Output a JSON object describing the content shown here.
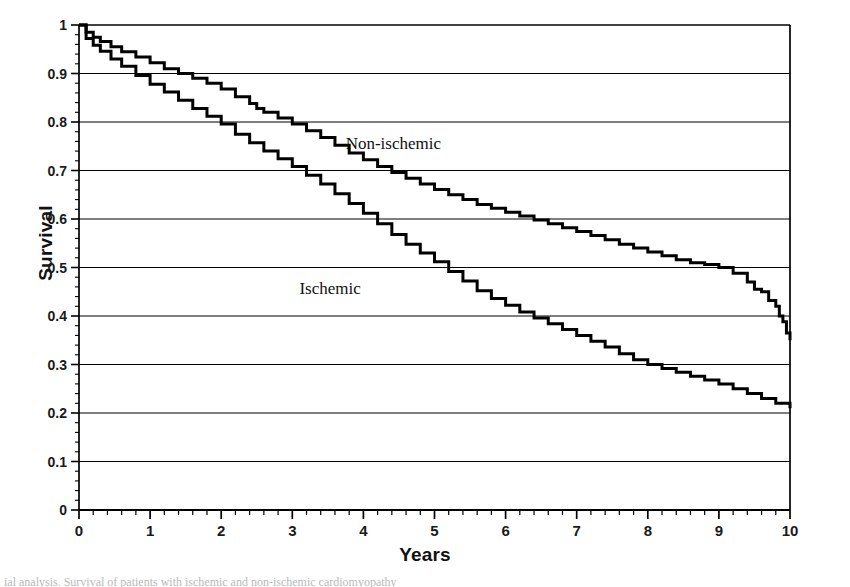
{
  "figure": {
    "background": "#ffffff",
    "ink": "#000000",
    "caption_partial": "ial analysis. Survival of patients with ischemic and non-ischemic cardiomyopathy"
  },
  "chart_data": {
    "type": "line",
    "title": "",
    "subtitle": "",
    "xlabel": "Years",
    "ylabel": "Survival",
    "xlim": [
      0,
      10
    ],
    "ylim": [
      0,
      1
    ],
    "grid": "horizontal",
    "legend_position": "inline-annotation",
    "x_major_step": 1,
    "x_minor_step": 0.2,
    "y_major_step": 0.1,
    "y_minor_step": 0.02,
    "xticks": [
      "0",
      "1",
      "2",
      "3",
      "4",
      "5",
      "6",
      "7",
      "8",
      "9",
      "10"
    ],
    "yticks": [
      "0",
      "0.1",
      "0.2",
      "0.3",
      "0.4",
      "0.5",
      "0.6",
      "0.7",
      "0.8",
      "0.9",
      "1"
    ],
    "annotations": [
      {
        "text": "Non-ischemic",
        "x": 3.75,
        "y": 0.755
      },
      {
        "text": "Ischemic",
        "x": 3.1,
        "y": 0.455
      }
    ],
    "series": [
      {
        "name": "Non-ischemic",
        "color": "#000000",
        "line_width": 3.0,
        "style": "step",
        "x": [
          0,
          0.1,
          0.2,
          0.3,
          0.45,
          0.6,
          0.8,
          1.0,
          1.2,
          1.4,
          1.6,
          1.8,
          2.0,
          2.2,
          2.4,
          2.5,
          2.6,
          2.8,
          3.0,
          3.2,
          3.4,
          3.6,
          3.8,
          4.0,
          4.2,
          4.4,
          4.6,
          4.8,
          5.0,
          5.2,
          5.4,
          5.6,
          5.8,
          6.0,
          6.2,
          6.4,
          6.6,
          6.8,
          7.0,
          7.2,
          7.4,
          7.6,
          7.8,
          8.0,
          8.2,
          8.4,
          8.6,
          8.8,
          9.0,
          9.2,
          9.4,
          9.5,
          9.6,
          9.7,
          9.8,
          9.85,
          9.9,
          9.95,
          10.0
        ],
        "y": [
          1.0,
          0.985,
          0.975,
          0.966,
          0.955,
          0.945,
          0.934,
          0.922,
          0.91,
          0.9,
          0.89,
          0.88,
          0.868,
          0.852,
          0.838,
          0.828,
          0.82,
          0.808,
          0.796,
          0.782,
          0.768,
          0.752,
          0.736,
          0.722,
          0.708,
          0.696,
          0.684,
          0.672,
          0.661,
          0.65,
          0.64,
          0.63,
          0.622,
          0.614,
          0.606,
          0.598,
          0.59,
          0.582,
          0.574,
          0.566,
          0.557,
          0.548,
          0.54,
          0.532,
          0.524,
          0.516,
          0.51,
          0.506,
          0.5,
          0.488,
          0.47,
          0.455,
          0.45,
          0.432,
          0.42,
          0.4,
          0.388,
          0.365,
          0.35
        ]
      },
      {
        "name": "Ischemic",
        "color": "#000000",
        "line_width": 3.0,
        "style": "step",
        "x": [
          0,
          0.1,
          0.2,
          0.3,
          0.45,
          0.6,
          0.8,
          1.0,
          1.2,
          1.4,
          1.6,
          1.8,
          2.0,
          2.2,
          2.4,
          2.6,
          2.8,
          3.0,
          3.2,
          3.4,
          3.6,
          3.8,
          4.0,
          4.2,
          4.4,
          4.6,
          4.8,
          5.0,
          5.2,
          5.4,
          5.6,
          5.8,
          6.0,
          6.2,
          6.4,
          6.6,
          6.8,
          7.0,
          7.2,
          7.4,
          7.6,
          7.8,
          8.0,
          8.2,
          8.4,
          8.6,
          8.8,
          9.0,
          9.2,
          9.4,
          9.6,
          9.8,
          10.0
        ],
        "y": [
          1.0,
          0.972,
          0.958,
          0.946,
          0.93,
          0.915,
          0.896,
          0.878,
          0.862,
          0.845,
          0.828,
          0.812,
          0.796,
          0.775,
          0.757,
          0.74,
          0.724,
          0.708,
          0.69,
          0.672,
          0.652,
          0.632,
          0.612,
          0.59,
          0.568,
          0.548,
          0.53,
          0.512,
          0.492,
          0.472,
          0.452,
          0.436,
          0.422,
          0.408,
          0.396,
          0.384,
          0.372,
          0.36,
          0.348,
          0.336,
          0.322,
          0.31,
          0.3,
          0.292,
          0.284,
          0.276,
          0.268,
          0.26,
          0.25,
          0.24,
          0.23,
          0.22,
          0.21
        ]
      }
    ]
  }
}
